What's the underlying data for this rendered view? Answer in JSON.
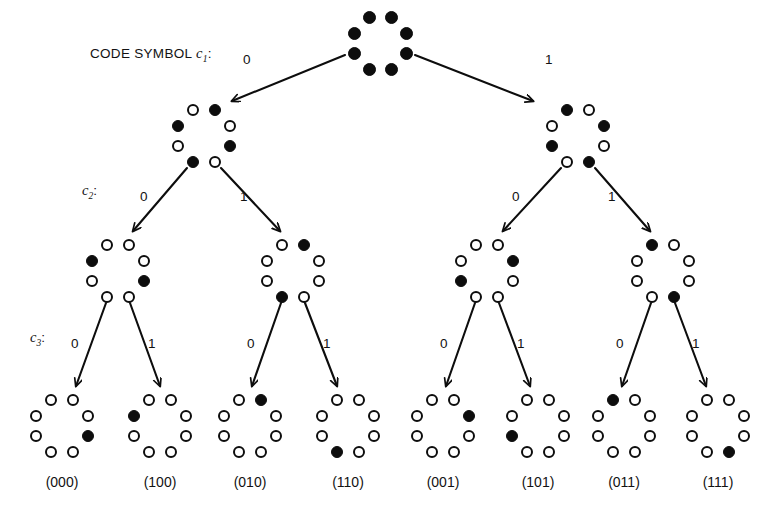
{
  "figure": {
    "type": "binary-tree-diagram",
    "background_color": "#ffffff",
    "ink_color": "#0d0d0d",
    "canvas": {
      "width": 768,
      "height": 516
    }
  },
  "labels": {
    "header_prefix": "CODE SYMBOL ",
    "header_var": "c",
    "header_sub": "1",
    "header_colon": ":",
    "row2_var": "c",
    "row2_sub": "2",
    "row2_colon": ":",
    "row3_var": "c",
    "row3_sub": "3",
    "row3_colon": ":",
    "bit_zero": "0",
    "bit_one": "1"
  },
  "branch_labels": {
    "level1": [
      {
        "text": "0",
        "x": 243,
        "y": 53
      },
      {
        "text": "1",
        "x": 545,
        "y": 53
      }
    ],
    "level2": [
      {
        "text": "0",
        "x": 140,
        "y": 190
      },
      {
        "text": "1",
        "x": 240,
        "y": 190
      },
      {
        "text": "0",
        "x": 512,
        "y": 190
      },
      {
        "text": "1",
        "x": 608,
        "y": 190
      }
    ],
    "level3": [
      {
        "text": "0",
        "x": 71,
        "y": 337
      },
      {
        "text": "1",
        "x": 148,
        "y": 337
      },
      {
        "text": "0",
        "x": 247,
        "y": 337
      },
      {
        "text": "1",
        "x": 323,
        "y": 337
      },
      {
        "text": "0",
        "x": 440,
        "y": 337
      },
      {
        "text": "1",
        "x": 517,
        "y": 337
      },
      {
        "text": "0",
        "x": 616,
        "y": 337
      },
      {
        "text": "1",
        "x": 692,
        "y": 337
      }
    ]
  },
  "row_labels": [
    {
      "name": "code-symbol-c1",
      "x": 90,
      "y": 46
    },
    {
      "name": "code-symbol-c2",
      "x": 82,
      "y": 183
    },
    {
      "name": "code-symbol-c3",
      "x": 30,
      "y": 330
    }
  ],
  "ring_geometry": {
    "positions": [
      {
        "key": "top-left",
        "dx": -11,
        "dy": -25
      },
      {
        "key": "top-right",
        "dx": 11,
        "dy": -25
      },
      {
        "key": "right-upper",
        "dx": 26,
        "dy": -9
      },
      {
        "key": "right-lower",
        "dx": 26,
        "dy": 11
      },
      {
        "key": "bottom-right",
        "dx": 11,
        "dy": 27
      },
      {
        "key": "bottom-left",
        "dx": -11,
        "dy": 27
      },
      {
        "key": "left-lower",
        "dx": -26,
        "dy": 11
      },
      {
        "key": "left-upper",
        "dx": -26,
        "dy": -9
      }
    ],
    "dot_diameter_root": 13,
    "dot_diameter_node": 12
  },
  "nodes": [
    {
      "id": "root",
      "name": "node-root",
      "level": 0,
      "x": 380,
      "y": 42,
      "dot_size": 13,
      "states": [
        "filled",
        "filled",
        "filled",
        "filled",
        "filled",
        "filled",
        "filled",
        "filled"
      ]
    },
    {
      "id": "L0",
      "name": "node-level1-0",
      "level": 1,
      "x": 204,
      "y": 135,
      "dot_size": 12,
      "states": [
        "open",
        "filled",
        "open",
        "filled",
        "open",
        "filled",
        "open",
        "filled"
      ]
    },
    {
      "id": "L1",
      "name": "node-level1-1",
      "level": 1,
      "x": 578,
      "y": 135,
      "dot_size": 12,
      "states": [
        "filled",
        "open",
        "filled",
        "open",
        "filled",
        "open",
        "filled",
        "open"
      ]
    },
    {
      "id": "LL0",
      "name": "node-level2-0",
      "level": 2,
      "x": 118,
      "y": 270,
      "dot_size": 12,
      "states": [
        "open",
        "open",
        "open",
        "filled",
        "open",
        "open",
        "open",
        "filled"
      ]
    },
    {
      "id": "LL1",
      "name": "node-level2-1",
      "level": 2,
      "x": 293,
      "y": 270,
      "dot_size": 12,
      "states": [
        "open",
        "filled",
        "open",
        "open",
        "open",
        "filled",
        "open",
        "open"
      ]
    },
    {
      "id": "LL2",
      "name": "node-level2-2",
      "level": 2,
      "x": 487,
      "y": 270,
      "dot_size": 12,
      "states": [
        "open",
        "open",
        "filled",
        "open",
        "open",
        "open",
        "filled",
        "open"
      ]
    },
    {
      "id": "LL3",
      "name": "node-level2-3",
      "level": 2,
      "x": 663,
      "y": 270,
      "dot_size": 12,
      "states": [
        "filled",
        "open",
        "open",
        "open",
        "filled",
        "open",
        "open",
        "open"
      ]
    },
    {
      "id": "LF0",
      "name": "node-leaf-000",
      "level": 3,
      "x": 62,
      "y": 425,
      "dot_size": 12,
      "states": [
        "open",
        "open",
        "open",
        "filled",
        "open",
        "open",
        "open",
        "open"
      ],
      "code": "(000)"
    },
    {
      "id": "LF1",
      "name": "node-leaf-100",
      "level": 3,
      "x": 160,
      "y": 425,
      "dot_size": 12,
      "states": [
        "open",
        "open",
        "open",
        "open",
        "open",
        "open",
        "open",
        "filled"
      ],
      "code": "(100)"
    },
    {
      "id": "LF2",
      "name": "node-leaf-010",
      "level": 3,
      "x": 250,
      "y": 425,
      "dot_size": 12,
      "states": [
        "open",
        "filled",
        "open",
        "open",
        "open",
        "open",
        "open",
        "open"
      ],
      "code": "(010)"
    },
    {
      "id": "LF3",
      "name": "node-leaf-110",
      "level": 3,
      "x": 348,
      "y": 425,
      "dot_size": 12,
      "states": [
        "open",
        "open",
        "open",
        "open",
        "open",
        "filled",
        "open",
        "open"
      ],
      "code": "(110)"
    },
    {
      "id": "LF4",
      "name": "node-leaf-001",
      "level": 3,
      "x": 443,
      "y": 425,
      "dot_size": 12,
      "states": [
        "open",
        "open",
        "filled",
        "open",
        "open",
        "open",
        "open",
        "open"
      ],
      "code": "(001)"
    },
    {
      "id": "LF5",
      "name": "node-leaf-101",
      "level": 3,
      "x": 538,
      "y": 425,
      "dot_size": 12,
      "states": [
        "open",
        "open",
        "open",
        "open",
        "open",
        "open",
        "filled",
        "open"
      ],
      "code": "(101)"
    },
    {
      "id": "LF6",
      "name": "node-leaf-011",
      "level": 3,
      "x": 624,
      "y": 425,
      "dot_size": 12,
      "states": [
        "filled",
        "open",
        "open",
        "open",
        "open",
        "open",
        "open",
        "open"
      ],
      "code": "(011)"
    },
    {
      "id": "LF7",
      "name": "node-leaf-111",
      "level": 3,
      "x": 718,
      "y": 425,
      "dot_size": 12,
      "states": [
        "open",
        "open",
        "open",
        "open",
        "filled",
        "open",
        "open",
        "open"
      ],
      "code": "(111)"
    }
  ],
  "leaf_code_y": 474,
  "edges": [
    {
      "name": "edge-root-to-level1-0",
      "x1": 345,
      "y1": 55,
      "x2": 232,
      "y2": 101,
      "bit": "0"
    },
    {
      "name": "edge-root-to-level1-1",
      "x1": 415,
      "y1": 55,
      "x2": 533,
      "y2": 101,
      "bit": "1"
    },
    {
      "name": "edge-level1-0-to-level2-0",
      "x1": 187,
      "y1": 168,
      "x2": 133,
      "y2": 231,
      "bit": "0"
    },
    {
      "name": "edge-level1-0-to-level2-1",
      "x1": 221,
      "y1": 168,
      "x2": 280,
      "y2": 231,
      "bit": "1"
    },
    {
      "name": "edge-level1-1-to-level2-2",
      "x1": 561,
      "y1": 168,
      "x2": 503,
      "y2": 231,
      "bit": "0"
    },
    {
      "name": "edge-level1-1-to-level2-3",
      "x1": 595,
      "y1": 168,
      "x2": 650,
      "y2": 231,
      "bit": "1"
    },
    {
      "name": "edge-level2-0-to-leaf-000",
      "x1": 106,
      "y1": 303,
      "x2": 76,
      "y2": 386,
      "bit": "0"
    },
    {
      "name": "edge-level2-0-to-leaf-100",
      "x1": 130,
      "y1": 303,
      "x2": 160,
      "y2": 386,
      "bit": "1"
    },
    {
      "name": "edge-level2-1-to-leaf-010",
      "x1": 281,
      "y1": 303,
      "x2": 252,
      "y2": 386,
      "bit": "0"
    },
    {
      "name": "edge-level2-1-to-leaf-110",
      "x1": 305,
      "y1": 303,
      "x2": 337,
      "y2": 386,
      "bit": "1"
    },
    {
      "name": "edge-level2-2-to-leaf-001",
      "x1": 475,
      "y1": 303,
      "x2": 446,
      "y2": 386,
      "bit": "0"
    },
    {
      "name": "edge-level2-2-to-leaf-101",
      "x1": 499,
      "y1": 303,
      "x2": 530,
      "y2": 386,
      "bit": "1"
    },
    {
      "name": "edge-level2-3-to-leaf-011",
      "x1": 651,
      "y1": 303,
      "x2": 622,
      "y2": 386,
      "bit": "0"
    },
    {
      "name": "edge-level2-3-to-leaf-111",
      "x1": 675,
      "y1": 303,
      "x2": 706,
      "y2": 386,
      "bit": "1"
    }
  ]
}
